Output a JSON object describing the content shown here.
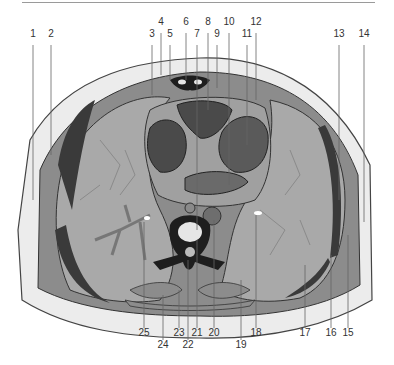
{
  "figure": {
    "title": "",
    "colors": {
      "skin_outline": "#444444",
      "fat": "#ececec",
      "muscle": "#8c8c8c",
      "muscle_dark": "#3a3a3a",
      "lung": "#a9a9a9",
      "heart_chamber": "#4a4a4a",
      "heart_wall": "#a0a0a0",
      "bone": "#1e1e1e",
      "bone_inner": "#e6e6e6",
      "vessel": "#6e6e6e",
      "bronchus": "#777777",
      "leader_line": "#666666"
    },
    "labels_top": [
      {
        "id": "1",
        "text": "1",
        "x": 33,
        "y": 33
      },
      {
        "id": "2",
        "text": "2",
        "x": 51,
        "y": 33
      },
      {
        "id": "3",
        "text": "3",
        "x": 152,
        "y": 33
      },
      {
        "id": "4",
        "text": "4",
        "x": 161,
        "y": 21
      },
      {
        "id": "5",
        "text": "5",
        "x": 170,
        "y": 33
      },
      {
        "id": "6",
        "text": "6",
        "x": 186,
        "y": 21
      },
      {
        "id": "7",
        "text": "7",
        "x": 197,
        "y": 33
      },
      {
        "id": "8",
        "text": "8",
        "x": 208,
        "y": 21
      },
      {
        "id": "9",
        "text": "9",
        "x": 217,
        "y": 33
      },
      {
        "id": "10",
        "text": "10",
        "x": 229,
        "y": 21
      },
      {
        "id": "11",
        "text": "11",
        "x": 247,
        "y": 33
      },
      {
        "id": "12",
        "text": "12",
        "x": 256,
        "y": 21
      },
      {
        "id": "13",
        "text": "13",
        "x": 339,
        "y": 33
      },
      {
        "id": "14",
        "text": "14",
        "x": 364,
        "y": 33
      }
    ],
    "labels_bottom": [
      {
        "id": "25",
        "text": "25",
        "x": 144,
        "y": 331
      },
      {
        "id": "24",
        "text": "24",
        "x": 163,
        "y": 343
      },
      {
        "id": "23",
        "text": "23",
        "x": 179,
        "y": 331
      },
      {
        "id": "22",
        "text": "22",
        "x": 188,
        "y": 343
      },
      {
        "id": "21",
        "text": "21",
        "x": 197,
        "y": 331
      },
      {
        "id": "20",
        "text": "20",
        "x": 214,
        "y": 331
      },
      {
        "id": "19",
        "text": "19",
        "x": 241,
        "y": 343
      },
      {
        "id": "18",
        "text": "18",
        "x": 256,
        "y": 331
      },
      {
        "id": "17",
        "text": "17",
        "x": 305,
        "y": 331
      },
      {
        "id": "16",
        "text": "16",
        "x": 331,
        "y": 331
      },
      {
        "id": "15",
        "text": "15",
        "x": 348,
        "y": 331
      }
    ]
  }
}
